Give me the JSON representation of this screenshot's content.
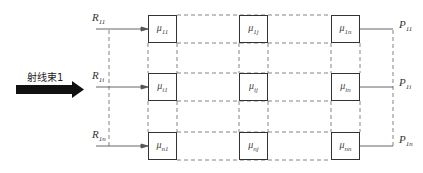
{
  "diagram": {
    "beam_label": "射线束1",
    "inputs": [
      {
        "symbol": "R",
        "sub": "11"
      },
      {
        "symbol": "R",
        "sub": "1i"
      },
      {
        "symbol": "R",
        "sub": "1n"
      }
    ],
    "outputs": [
      {
        "symbol": "P",
        "sub": "11"
      },
      {
        "symbol": "P",
        "sub": "1i"
      },
      {
        "symbol": "P",
        "sub": "1n"
      }
    ],
    "cells": [
      [
        {
          "symbol": "μ",
          "sub": "11"
        },
        {
          "symbol": "μ",
          "sub": "1j"
        },
        {
          "symbol": "μ",
          "sub": "1n"
        }
      ],
      [
        {
          "symbol": "μ",
          "sub": "i1"
        },
        {
          "symbol": "μ",
          "sub": "ij"
        },
        {
          "symbol": "μ",
          "sub": "in"
        }
      ],
      [
        {
          "symbol": "μ",
          "sub": "n1"
        },
        {
          "symbol": "μ",
          "sub": "nj"
        },
        {
          "symbol": "μ",
          "sub": "nn"
        }
      ]
    ],
    "colors": {
      "line": "#555555",
      "box": "#333333",
      "arrow": "#111111"
    }
  }
}
